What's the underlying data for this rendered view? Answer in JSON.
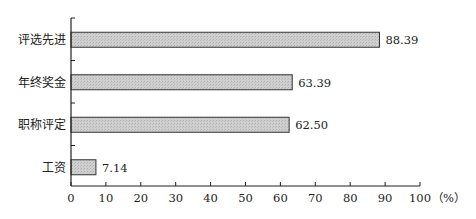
{
  "chart_data": {
    "type": "bar",
    "orientation": "horizontal",
    "title": "",
    "xlabel": "（%）",
    "ylabel": "",
    "categories": [
      "评选先进",
      "年终奖金",
      "职称评定",
      "工资"
    ],
    "values": [
      88.39,
      63.39,
      62.5,
      7.14
    ],
    "value_labels": [
      "88.39",
      "63.39",
      "62.50",
      "7.14"
    ],
    "xlim": [
      0,
      100
    ],
    "xticks": [
      0,
      10,
      20,
      30,
      40,
      50,
      60,
      70,
      80,
      90,
      100
    ],
    "xtick_labels": [
      "0",
      "10",
      "20",
      "30",
      "40",
      "50",
      "60",
      "70",
      "80",
      "90",
      "100"
    ],
    "unit_label": "（%）",
    "grid": false,
    "legend": null,
    "bar_fill": "#c8c8c8",
    "bar_stroke": "#333333"
  }
}
